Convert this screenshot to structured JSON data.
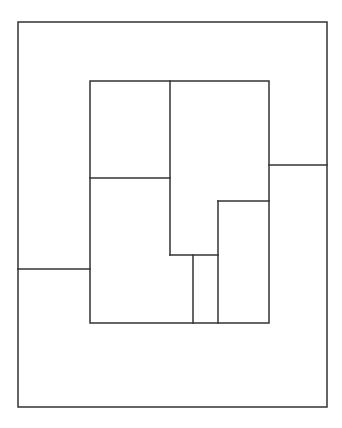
{
  "diagram": {
    "type": "floor-plan-partition",
    "stroke_color": "#333333",
    "background": "#ffffff",
    "stroke_width": 1.5,
    "outer_rect": {
      "x": 18,
      "y": 22,
      "w": 309,
      "h": 385
    },
    "inner_rect": {
      "x": 90,
      "y": 81,
      "w": 179,
      "h": 242
    },
    "lines": [
      {
        "name": "inner-left-horizontal",
        "x1": 90,
        "y1": 178,
        "x2": 170,
        "y2": 178
      },
      {
        "name": "inner-center-vertical",
        "x1": 170,
        "y1": 81,
        "x2": 170,
        "y2": 255
      },
      {
        "name": "inner-lower-horizontal",
        "x1": 170,
        "y1": 255,
        "x2": 218,
        "y2": 255
      },
      {
        "name": "inner-small-vertical",
        "x1": 193,
        "y1": 255,
        "x2": 193,
        "y2": 323
      },
      {
        "name": "inner-right-box-top",
        "x1": 218,
        "y1": 201,
        "x2": 269,
        "y2": 201
      },
      {
        "name": "inner-right-box-left",
        "x1": 218,
        "y1": 201,
        "x2": 218,
        "y2": 323
      },
      {
        "name": "outer-right-horizontal",
        "x1": 269,
        "y1": 165,
        "x2": 327,
        "y2": 165
      },
      {
        "name": "outer-left-horizontal",
        "x1": 18,
        "y1": 269,
        "x2": 90,
        "y2": 269
      }
    ]
  }
}
